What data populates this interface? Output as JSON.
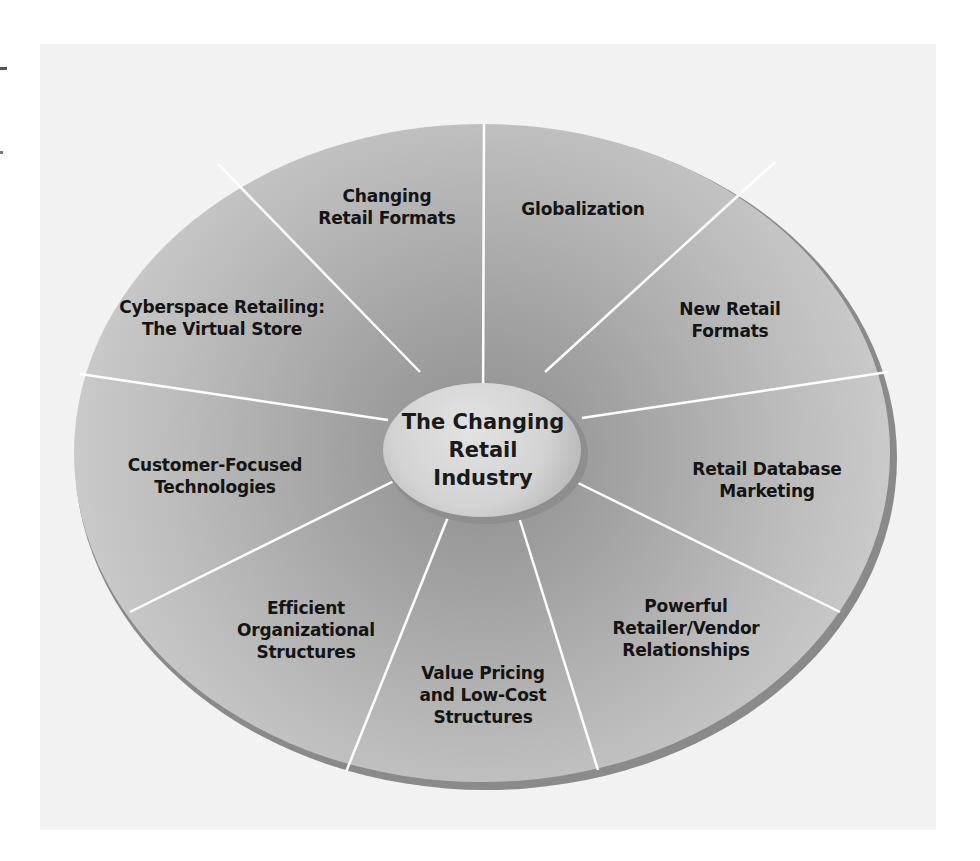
{
  "diagram": {
    "center": {
      "lines": [
        "The Changing",
        "Retail",
        "Industry"
      ]
    },
    "segments": [
      {
        "id": "globalization",
        "lines": [
          "Globalization"
        ]
      },
      {
        "id": "new-retail-formats",
        "lines": [
          "New Retail",
          "Formats"
        ]
      },
      {
        "id": "retail-database-marketing",
        "lines": [
          "Retail Database",
          "Marketing"
        ]
      },
      {
        "id": "powerful-retailer-vendor-relationships",
        "lines": [
          "Powerful",
          "Retailer/Vendor",
          "Relationships"
        ]
      },
      {
        "id": "value-pricing",
        "lines": [
          "Value Pricing",
          "and Low-Cost",
          "Structures"
        ]
      },
      {
        "id": "efficient-organizational-structures",
        "lines": [
          "Efficient",
          "Organizational",
          "Structures"
        ]
      },
      {
        "id": "customer-focused-technologies",
        "lines": [
          "Customer-Focused",
          "Technologies"
        ]
      },
      {
        "id": "cyberspace-retailing",
        "lines": [
          "Cyberspace Retailing:",
          "The Virtual Store"
        ]
      },
      {
        "id": "changing-retail-formats",
        "lines": [
          "Changing",
          "Retail Formats"
        ]
      }
    ],
    "colors": {
      "panel_background": "#f2f2f2",
      "wheel_fill_light": "#d2d2d2",
      "wheel_fill_dark": "#9a9a9a",
      "center_fill": "#d8d8d8",
      "divider": "#ffffff",
      "text": "#141414"
    }
  }
}
